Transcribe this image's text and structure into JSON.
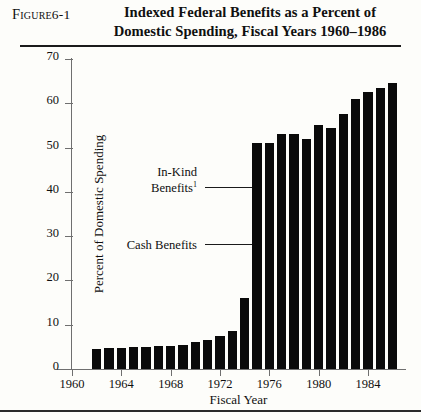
{
  "figure": {
    "label_prefix": "Figure",
    "label_number": "6-1",
    "title_line1": "Indexed Federal Benefits as a Percent of",
    "title_line2": "Domestic Spending, Fiscal Years 1960–1986"
  },
  "annotations": [
    {
      "name": "in-kind-benefits",
      "line1": "In-Kind",
      "line2": "Benefits",
      "superscript": "1"
    },
    {
      "name": "cash-benefits",
      "line1": "Cash Benefits",
      "line2": "",
      "superscript": ""
    }
  ],
  "chart_data": {
    "type": "bar",
    "title": "Indexed Federal Benefits as a Percent of Domestic Spending, Fiscal Years 1960–1986",
    "xlabel": "Fiscal Year",
    "ylabel": "Percent of Domestic Spending",
    "ylim": [
      0,
      70
    ],
    "xlim": [
      1960,
      1987
    ],
    "ytick_labels": [
      "0",
      "10",
      "20",
      "30",
      "40",
      "50",
      "60",
      "70"
    ],
    "ytick_values": [
      0,
      10,
      20,
      30,
      40,
      50,
      60,
      70
    ],
    "xtick_labels": [
      "1960",
      "1964",
      "1968",
      "1972",
      "1976",
      "1980",
      "1984"
    ],
    "xtick_values": [
      1960,
      1964,
      1968,
      1972,
      1976,
      1980,
      1984
    ],
    "grid": false,
    "legend": false,
    "bar_color": "#0a0a0a",
    "categories": [
      1962,
      1963,
      1964,
      1965,
      1966,
      1967,
      1968,
      1969,
      1970,
      1971,
      1972,
      1973,
      1974,
      1975,
      1976,
      1977,
      1978,
      1979,
      1980,
      1981,
      1982,
      1983,
      1984,
      1985,
      1986
    ],
    "values": [
      4.5,
      4.7,
      4.8,
      5.0,
      5.0,
      5.2,
      5.3,
      5.5,
      6.0,
      6.6,
      7.4,
      8.5,
      16.0,
      51.0,
      51.0,
      53.0,
      53.0,
      52.0,
      55.0,
      54.5,
      57.5,
      61.0,
      62.5,
      63.5,
      64.5
    ]
  }
}
